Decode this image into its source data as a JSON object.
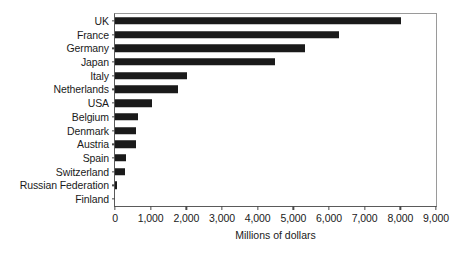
{
  "chart_data": {
    "type": "bar",
    "orientation": "horizontal",
    "title": "",
    "xlabel": "Millions of dollars",
    "ylabel": "",
    "xlim": [
      0,
      9000
    ],
    "xticks": [
      "0",
      "1,000",
      "2,000",
      "3,000",
      "4,000",
      "5,000",
      "6,000",
      "7,000",
      "8,000",
      "9,000"
    ],
    "xtick_values": [
      0,
      1000,
      2000,
      3000,
      4000,
      5000,
      6000,
      7000,
      8000,
      9000
    ],
    "grid": false,
    "legend": false,
    "bar_color": "#1a1a1a",
    "categories": [
      "UK",
      "France",
      "Germany",
      "Japan",
      "Italy",
      "Netherlands",
      "USA",
      "Belgium",
      "Denmark",
      "Austria",
      "Spain",
      "Switzerland",
      "Russian Federation",
      "Finland"
    ],
    "values": [
      8020,
      6270,
      5320,
      4480,
      2030,
      1780,
      1030,
      640,
      585,
      585,
      305,
      280,
      60,
      0
    ],
    "series": [
      {
        "name": "Millions of dollars",
        "values": [
          8020,
          6270,
          5320,
          4480,
          2030,
          1780,
          1030,
          640,
          585,
          585,
          305,
          280,
          60,
          0
        ]
      }
    ]
  }
}
